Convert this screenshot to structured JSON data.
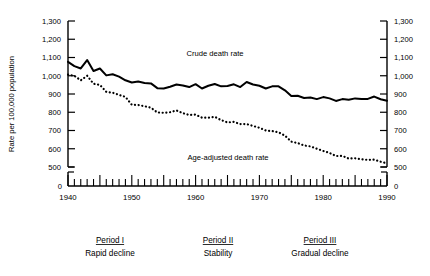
{
  "chart_data": {
    "type": "line",
    "title": "",
    "xlabel": "",
    "ylabel": "Rate per 100,000 population",
    "xlim": [
      1940,
      1990
    ],
    "ylim": [
      500,
      1300
    ],
    "y_axis_break_at": 500,
    "y_zero_label": "0",
    "grid": false,
    "legend": "inline-annotations",
    "ytick_labels": [
      "1,300",
      "1,200",
      "1,100",
      "1,000",
      "900",
      "800",
      "700",
      "600",
      "500"
    ],
    "ytick_values": [
      1300,
      1200,
      1100,
      1000,
      900,
      800,
      700,
      600,
      500
    ],
    "xtick_labels": [
      "1940",
      "1950",
      "1960",
      "1970",
      "1980",
      "1990"
    ],
    "xtick_values": [
      1940,
      1950,
      1960,
      1970,
      1980,
      1990
    ],
    "x_minor_tick_interval": 1,
    "x": [
      1940,
      1941,
      1942,
      1943,
      1944,
      1945,
      1946,
      1947,
      1948,
      1949,
      1950,
      1951,
      1952,
      1953,
      1954,
      1955,
      1956,
      1957,
      1958,
      1959,
      1960,
      1961,
      1962,
      1963,
      1964,
      1965,
      1966,
      1967,
      1968,
      1969,
      1970,
      1971,
      1972,
      1973,
      1974,
      1975,
      1976,
      1977,
      1978,
      1979,
      1980,
      1981,
      1982,
      1983,
      1984,
      1985,
      1986,
      1987,
      1988,
      1989,
      1990
    ],
    "series": [
      {
        "name": "Crude death rate",
        "style": "solid",
        "label_x": 1963,
        "label_y": 1130,
        "values": [
          1076,
          1053,
          1040,
          1086,
          1026,
          1040,
          1002,
          1008,
          995,
          975,
          963,
          968,
          960,
          958,
          932,
          930,
          940,
          952,
          947,
          938,
          954,
          930,
          945,
          955,
          942,
          944,
          953,
          938,
          966,
          952,
          945,
          930,
          942,
          942,
          920,
          889,
          890,
          878,
          881,
          872,
          883,
          876,
          862,
          872,
          868,
          876,
          873,
          873,
          886,
          871,
          863
        ]
      },
      {
        "name": "Age-adjusted death rate",
        "style": "dotted",
        "label_x": 1965,
        "label_y": 610,
        "values": [
          1006,
          1000,
          975,
          1000,
          956,
          950,
          912,
          907,
          895,
          884,
          841,
          840,
          833,
          825,
          799,
          797,
          800,
          810,
          795,
          785,
          787,
          770,
          770,
          775,
          757,
          744,
          747,
          735,
          735,
          725,
          715,
          700,
          697,
          690,
          672,
          639,
          631,
          618,
          613,
          600,
          588,
          577,
          560,
          561,
          546,
          548,
          542,
          539,
          540,
          529,
          520
        ]
      }
    ],
    "annotations": [
      {
        "name": "crude-death-rate-label",
        "text": "Crude death rate"
      },
      {
        "name": "age-adjusted-death-rate-label",
        "text": "Age-adjusted death rate"
      }
    ]
  },
  "axis": {
    "y_title": "Rate per 100,000 population",
    "zero_label": "0"
  },
  "periods": [
    {
      "title": "Period I",
      "subtitle": "Rapid decline",
      "center_x": 110
    },
    {
      "title": "Period II",
      "subtitle": "Stability",
      "center_x": 218
    },
    {
      "title": "Period III",
      "subtitle": "Gradual decline",
      "center_x": 320
    }
  ]
}
